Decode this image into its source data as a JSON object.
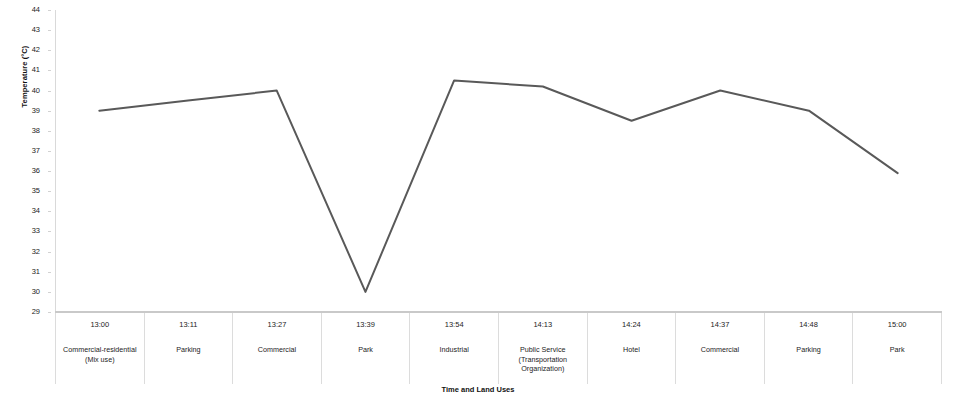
{
  "chart_data": {
    "type": "line",
    "title": "",
    "xlabel": "Time and Land Uses",
    "ylabel": "Temperature (°C)",
    "ylim": [
      29,
      44
    ],
    "yticks": [
      29,
      30,
      31,
      32,
      33,
      34,
      35,
      36,
      37,
      38,
      39,
      40,
      41,
      42,
      43,
      44
    ],
    "grid": false,
    "legend": "none",
    "line_color": "#595959",
    "categories": [
      "13:00",
      "13:11",
      "13:27",
      "13:39",
      "13:54",
      "14:13",
      "14:24",
      "14:37",
      "14:48",
      "15:00"
    ],
    "category_sublabels": [
      "Commercial-residential (Mix use)",
      "Parking",
      "Commercial",
      "Park",
      "Industrial",
      "Public Service (Transportation Organization)",
      "Hotel",
      "Commercial",
      "Parking",
      "Park"
    ],
    "series": [
      {
        "name": "Temperature",
        "values": [
          39.0,
          39.5,
          40.0,
          30.0,
          40.5,
          40.2,
          38.5,
          40.0,
          39.0,
          35.9
        ]
      }
    ]
  }
}
